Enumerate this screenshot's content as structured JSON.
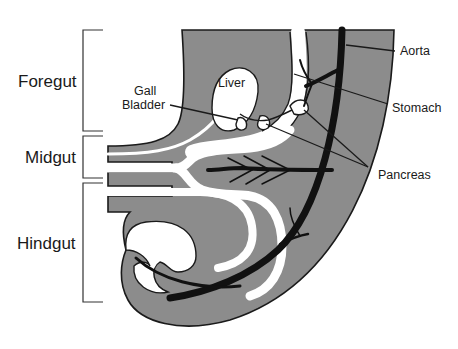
{
  "figure": {
    "type": "anatomical-diagram"
  },
  "regions": [
    {
      "label": "Foregut",
      "bracket_y": [
        30,
        131
      ]
    },
    {
      "label": "Midgut",
      "bracket_y": [
        136,
        178
      ]
    },
    {
      "label": "Hindgut",
      "bracket_y": [
        183,
        302
      ]
    }
  ],
  "labels": {
    "gall_bladder_line1": "Gall",
    "gall_bladder_line2": "Bladder",
    "liver": "Liver",
    "aorta": "Aorta",
    "stomach": "Stomach",
    "pancreas": "Pancreas"
  },
  "colors": {
    "tissue": "#8c8c8c",
    "outline": "#1a1a1a",
    "lumen": "#ffffff",
    "background": "#ffffff"
  }
}
